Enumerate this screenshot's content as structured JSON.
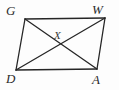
{
  "figure": {
    "type": "geometry-diagram",
    "shape": "parallelogram",
    "background_color": "#fdfdfd",
    "stroke_color": "#262626",
    "label_color": "#2b2b2b",
    "vertices": [
      {
        "name": "G",
        "label": "G",
        "x": 25,
        "y": 19,
        "label_x": 6,
        "label_y": 4
      },
      {
        "name": "W",
        "label": "W",
        "x": 105,
        "y": 18,
        "label_x": 92,
        "label_y": 3
      },
      {
        "name": "A",
        "label": "A",
        "x": 97,
        "y": 69,
        "label_x": 92,
        "label_y": 73
      },
      {
        "name": "D",
        "label": "D",
        "x": 16,
        "y": 70,
        "label_x": 6,
        "label_y": 72
      }
    ],
    "interior_points": [
      {
        "name": "X",
        "label": "X",
        "x": 60,
        "y": 44,
        "label_x": 54,
        "label_y": 30
      }
    ],
    "edges": [
      {
        "name": "side-GW",
        "from": "G",
        "to": "W"
      },
      {
        "name": "side-WA",
        "from": "W",
        "to": "A"
      },
      {
        "name": "side-AD",
        "from": "A",
        "to": "D"
      },
      {
        "name": "side-DG",
        "from": "D",
        "to": "G"
      }
    ],
    "diagonals": [
      {
        "name": "diagonal-GA",
        "from": "G",
        "to": "A"
      },
      {
        "name": "diagonal-WD",
        "from": "W",
        "to": "D"
      }
    ]
  }
}
